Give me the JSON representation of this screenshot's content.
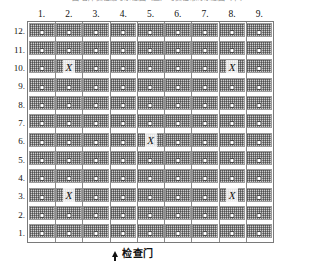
{
  "figure": {
    "top_caption": "图 仓库货位编号示意图（上）与货位布局示意图（下）",
    "gate_label": "检查门",
    "gate_arrow_icon": "arrow-up-icon"
  },
  "axes": {
    "column_headers": [
      "1.",
      "2.",
      "3.",
      "4.",
      "5.",
      "6.",
      "7.",
      "8.",
      "9."
    ],
    "row_headers": [
      "12.",
      "11.",
      "10.",
      "9.",
      "8.",
      "7.",
      "6.",
      "5.",
      "4.",
      "3.",
      "2.",
      "1."
    ]
  },
  "colors": {
    "bay_fill": "#cfcfcf",
    "bay_border": "#9a9a9a",
    "grid_border": "#7a7a7a",
    "port_fill": "#ffffff",
    "port_border": "#4a4a4a",
    "marker_color": "#111111",
    "background": "#ffffff"
  },
  "grid": {
    "columns": 9,
    "rows": 12,
    "port_icon": "white-square-port-icon"
  },
  "markers": [
    {
      "label": "X",
      "column": 2,
      "row": 10
    },
    {
      "label": "X",
      "column": 8,
      "row": 10
    },
    {
      "label": "X",
      "column": 5,
      "row": 6
    },
    {
      "label": "X",
      "column": 2,
      "row": 3
    },
    {
      "label": "X",
      "column": 8,
      "row": 3
    }
  ]
}
